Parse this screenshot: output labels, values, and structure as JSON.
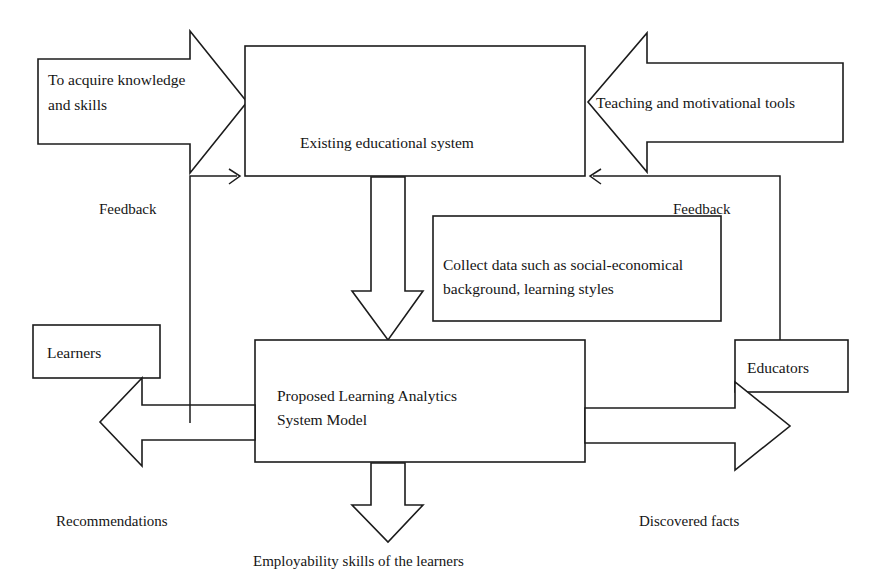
{
  "diagram": {
    "type": "block-flow-diagram",
    "background_color": "#ffffff",
    "line_color": "#1c1c1c",
    "text_color": "#151515",
    "nodes": {
      "existing_system": {
        "label": "Existing educational system"
      },
      "collect_data": {
        "line1": "Collect data such as social-economical",
        "line2": "background, learning styles"
      },
      "proposed_model": {
        "line1": "Proposed Learning Analytics",
        "line2": "System Model"
      },
      "learners": {
        "label": "Learners"
      },
      "educators": {
        "label": "Educators"
      }
    },
    "block_arrows": {
      "acquire_knowledge": {
        "line1": "To acquire knowledge",
        "line2": "and skills",
        "direction": "right"
      },
      "teaching_tools": {
        "label": "Teaching and motivational tools",
        "direction": "left"
      },
      "down_to_model": {
        "label": "",
        "direction": "down"
      },
      "to_learners": {
        "label": "",
        "direction": "left"
      },
      "to_educators": {
        "label": "",
        "direction": "right"
      },
      "to_employability": {
        "label": "",
        "direction": "down"
      }
    },
    "edge_labels": {
      "feedback_left": "Feedback",
      "feedback_right": "Feedback",
      "recommendations": "Recommendations",
      "discovered_facts": "Discovered facts",
      "employability": "Employability skills of the learners"
    }
  }
}
